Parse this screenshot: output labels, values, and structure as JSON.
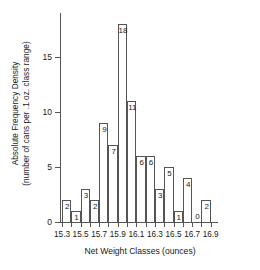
{
  "chart_data": {
    "type": "bar",
    "title": "",
    "xlabel": "Net Weight Classes (ounces)",
    "ylabel_line1": "Absolute Frequency Density",
    "ylabel_line2": "(number of cans per .1 oz. class range)",
    "categories": [
      "15.3",
      "15.4",
      "15.5",
      "15.6",
      "15.7",
      "15.8",
      "15.9",
      "16.0",
      "16.1",
      "16.2",
      "16.3",
      "16.4",
      "16.5",
      "16.6",
      "16.7",
      "16.8"
    ],
    "values": [
      2,
      1,
      3,
      2,
      9,
      7,
      18,
      11,
      6,
      6,
      3,
      5,
      1,
      4,
      0,
      2
    ],
    "bin_width": 0.1,
    "bin_start": 15.3,
    "bin_end": 16.9,
    "xlim": [
      15.3,
      16.9
    ],
    "ylim": [
      0,
      19
    ],
    "xtick_labels": [
      "15.3",
      "",
      "15.5",
      "",
      "15.7",
      "",
      "15.9",
      "",
      "16.1",
      "",
      "16.3",
      "",
      "16.5",
      "",
      "16.7",
      "",
      "16.9"
    ],
    "xtick_values": [
      15.3,
      15.4,
      15.5,
      15.6,
      15.7,
      15.8,
      15.9,
      16.0,
      16.1,
      16.2,
      16.3,
      16.4,
      16.5,
      16.6,
      16.7,
      16.8,
      16.9
    ],
    "ytick_labels": [
      "0",
      "5",
      "10",
      "15"
    ],
    "ytick_values": [
      0,
      5,
      10,
      15
    ],
    "grid": false,
    "legend": false,
    "bar_fill_color": "#ffffff",
    "bar_edge_color": "#555555",
    "axis_color": "#555555",
    "text_color": "#1a1a1a",
    "background_color": "#ffffff"
  }
}
